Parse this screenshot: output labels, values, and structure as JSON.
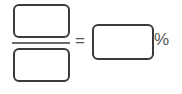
{
  "fraction": {
    "numerator_value": "",
    "denominator_value": ""
  },
  "equals_symbol": "=",
  "result": {
    "value": ""
  },
  "percent_symbol": "%",
  "colors": {
    "box_border": "#3a3a3a",
    "text": "#555555"
  }
}
